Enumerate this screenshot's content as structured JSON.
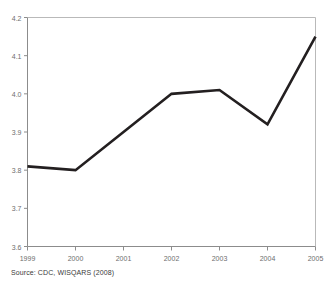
{
  "title_remnant": "",
  "source": {
    "text": "Source: CDC, WISQARS (2008)"
  },
  "axis": {
    "y_ticks": [
      "4.2",
      "4.1",
      "4.0",
      "3.9",
      "3.8",
      "3.7",
      "3.6"
    ],
    "x_ticks": [
      "1999",
      "2000",
      "2001",
      "2002",
      "2003",
      "2004",
      "2005"
    ]
  },
  "colors": {
    "line": "#231f20",
    "axis": "#8c8c8c",
    "tick_label": "#6e6e6e",
    "background": "#ffffff"
  },
  "chart_data": {
    "type": "line",
    "title": "",
    "subtitle": "",
    "xlabel": "",
    "ylabel": "",
    "categories": [
      "1999",
      "2000",
      "2001",
      "2002",
      "2003",
      "2004",
      "2005"
    ],
    "x": [
      1999,
      2000,
      2001,
      2002,
      2003,
      2004,
      2005
    ],
    "values": [
      3.81,
      3.8,
      3.9,
      4.0,
      4.01,
      3.92,
      4.15
    ],
    "series": [
      {
        "name": "Rate",
        "values": [
          3.81,
          3.8,
          3.9,
          4.0,
          4.01,
          3.92,
          4.15
        ]
      }
    ],
    "ylim": [
      3.6,
      4.2
    ],
    "ytick_step": 0.1,
    "xlim": [
      1999,
      2005
    ],
    "grid": false,
    "legend": "none",
    "annotations": [
      "Source: CDC, WISQARS (2008)"
    ]
  }
}
